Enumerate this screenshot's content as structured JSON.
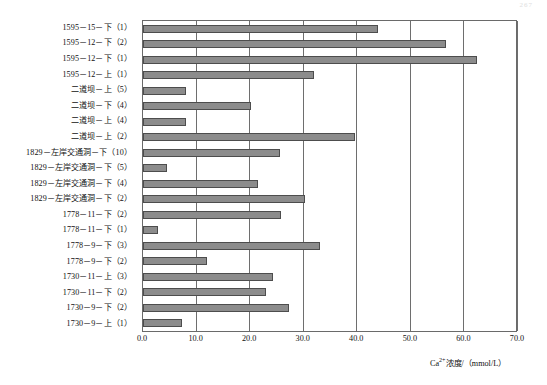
{
  "page": {
    "page_number": "267"
  },
  "chart_data": {
    "type": "bar",
    "orientation": "horizontal",
    "title": "",
    "xlabel": "Ca²⁺浓度/（mmol/L）",
    "ylabel": "",
    "xlim": [
      0.0,
      70.0
    ],
    "xticks": [
      "0.0",
      "10.0",
      "20.0",
      "30.0",
      "40.0",
      "50.0",
      "60.0",
      "70.0"
    ],
    "xtick_values": [
      0,
      10,
      20,
      30,
      40,
      50,
      60,
      70
    ],
    "grid": true,
    "legend": "none",
    "bar_color": "#8c8c8c",
    "bar_border_color": "#4d4d4d",
    "categories": [
      "1595－15－下（1）",
      "1595－12－下（2）",
      "1595－12－下（1）",
      "1595－12－上（1）",
      "二道坝－上（5）",
      "二道坝－下（4）",
      "二道坝－上（4）",
      "二道坝－上（2）",
      "1829－左岸交通洞－下（10）",
      "1829－左岸交通洞－下（5）",
      "1829－左岸交通洞－下（4）",
      "1829－左岸交通洞－下（2）",
      "1778－11－下（2）",
      "1778－11－下（1）",
      "1778－9－下（3）",
      "1778－9－下（2）",
      "1730－11－上（3）",
      "1730－11－下（2）",
      "1730－9－下（2）",
      "1730－9－上（1）"
    ],
    "values": [
      43.9,
      56.5,
      62.4,
      31.9,
      8.0,
      20.2,
      8.0,
      39.6,
      25.6,
      4.5,
      21.5,
      30.2,
      25.7,
      2.8,
      33.1,
      11.9,
      24.3,
      22.9,
      27.2,
      7.2
    ]
  }
}
